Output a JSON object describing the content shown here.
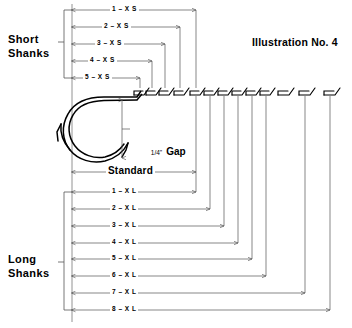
{
  "illustration": {
    "title": "Illustration No. 4",
    "type": "technical-diagram",
    "subject": "fishhook shank length comparison chart"
  },
  "groups": {
    "short": {
      "label_line1": "Short",
      "label_line2": "Shanks"
    },
    "long": {
      "label_line1": "Long",
      "label_line2": "Shanks"
    }
  },
  "gap": {
    "fraction": "1/4\"",
    "word": "Gap"
  },
  "standard": {
    "label": "Standard"
  },
  "short_sizes": [
    {
      "label": "1 – X S",
      "row_y": 10,
      "arrow_end_x": 196
    },
    {
      "label": "2 – X S",
      "row_y": 27,
      "arrow_end_x": 180
    },
    {
      "label": "3 – X S",
      "row_y": 44,
      "arrow_end_x": 165
    },
    {
      "label": "4 – X S",
      "row_y": 61,
      "arrow_end_x": 152
    },
    {
      "label": "5 – X S",
      "row_y": 78,
      "arrow_end_x": 140
    }
  ],
  "long_sizes": [
    {
      "label": "1 – X L",
      "row_y": 192,
      "arrow_end_x": 196
    },
    {
      "label": "2 – X L",
      "row_y": 209,
      "arrow_end_x": 210
    },
    {
      "label": "3 – X L",
      "row_y": 226,
      "arrow_end_x": 224
    },
    {
      "label": "4 – X L",
      "row_y": 243,
      "arrow_end_x": 238
    },
    {
      "label": "5 – X L",
      "row_y": 259,
      "arrow_end_x": 252
    },
    {
      "label": "6 – X L",
      "row_y": 276,
      "arrow_end_x": 266
    },
    {
      "label": "7 – X L",
      "row_y": 293,
      "arrow_end_x": 305
    },
    {
      "label": "8 – X L",
      "row_y": 310,
      "arrow_end_x": 330
    }
  ],
  "standard_row": {
    "label": "Standard",
    "row_y": 172,
    "arrow_end_x": 196
  },
  "hook_eyes": [
    {
      "x": 140
    },
    {
      "x": 152
    },
    {
      "x": 165
    },
    {
      "x": 180
    },
    {
      "x": 196
    },
    {
      "x": 210
    },
    {
      "x": 224
    },
    {
      "x": 238
    },
    {
      "x": 252
    },
    {
      "x": 266
    },
    {
      "x": 284
    },
    {
      "x": 305
    },
    {
      "x": 330
    }
  ],
  "colors": {
    "ink": "#000000",
    "line": "#555555",
    "paper": "#ffffff"
  }
}
